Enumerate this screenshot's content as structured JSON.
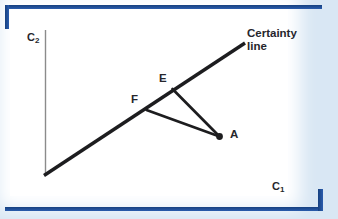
{
  "colors": {
    "page_background": "#d9e7f4",
    "panel_background": "#ffffff",
    "frame_blue": "#2257a8",
    "frame_blue_dark": "#16407f",
    "diagram_line_black": "#1d1d1f",
    "label_text": "#26262c",
    "y_axis_gray": "#8b8b8b",
    "x_axis_left": "#5f7276",
    "x_axis_right": "#ee8272"
  },
  "diagram": {
    "axes": {
      "y_label": {
        "base": "C",
        "sub": "2"
      },
      "x_label": {
        "base": "C",
        "sub": "1"
      },
      "y_axis": {
        "x1": 45.5,
        "y1": 30,
        "x2": 45.5,
        "y2": 175.5
      },
      "x_axis": {
        "x1": 44,
        "y1": 175.5,
        "x2": 288,
        "y2": 175.5
      }
    },
    "certainty_line": {
      "label_line1": "Certainty",
      "label_line2": "line",
      "geometry": {
        "x1": 44,
        "y1": 175.5,
        "x2": 245,
        "y2": 43
      }
    },
    "segments": {
      "e_to_a": {
        "x1": 172.5,
        "y1": 89,
        "x2": 219.5,
        "y2": 136.5
      },
      "f_to_a": {
        "x1": 146.5,
        "y1": 110,
        "x2": 219.5,
        "y2": 136.5
      }
    },
    "points": [
      {
        "label": "E",
        "x": 172.5,
        "y": 89,
        "label_left": 159,
        "label_top": 72
      },
      {
        "label": "F",
        "x": 146.5,
        "y": 110,
        "label_left": 131,
        "label_top": 93
      },
      {
        "label": "A",
        "x": 219.5,
        "y": 136.5,
        "label_left": 230,
        "label_top": 128
      }
    ],
    "marker": {
      "cx": 219.5,
      "cy": 136.5,
      "r": 3.4
    }
  }
}
